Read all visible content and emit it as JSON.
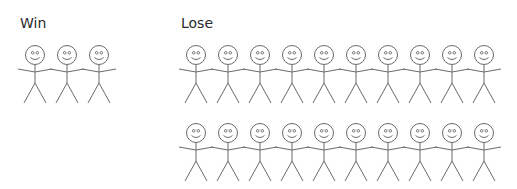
{
  "groups": [
    {
      "id": "win",
      "label": "Win",
      "figure_count": 3,
      "rows": [
        {
          "head_y": 55,
          "x": [
            35,
            67,
            99
          ]
        }
      ]
    },
    {
      "id": "lose",
      "label": "Lose",
      "figure_count": 20,
      "rows": [
        {
          "head_y": 55,
          "x": [
            196,
            228,
            260,
            292,
            324,
            356,
            388,
            420,
            452,
            484
          ]
        },
        {
          "head_y": 133,
          "x": [
            196,
            228,
            260,
            292,
            324,
            356,
            388,
            420,
            452,
            484
          ]
        }
      ]
    }
  ],
  "icons": {
    "figure": "stick-figure-smiley-icon"
  },
  "colors": {
    "stroke": "#6a6a6a",
    "text": "#2a2a2a",
    "background": "#ffffff"
  }
}
